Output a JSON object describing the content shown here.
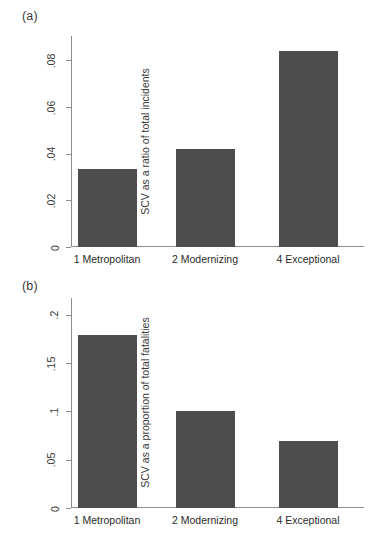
{
  "figure": {
    "panels": [
      {
        "panel_label": "(a)",
        "ylabel": "SCV as a ratio of total incidents",
        "yticks": [
          "0",
          ".02",
          ".04",
          ".06",
          ".08"
        ],
        "categories": [
          "1 Metropolitan",
          "2 Modernizing",
          "4 Exceptional"
        ]
      },
      {
        "panel_label": "(b)",
        "ylabel": "SCV as a proportion of total fatalities",
        "yticks": [
          "0",
          ".05",
          ".1",
          ".15",
          ".2"
        ],
        "categories": [
          "1 Metropolitan",
          "2 Modernizing",
          "4 Exceptional"
        ]
      }
    ]
  },
  "chart_data": [
    {
      "type": "bar",
      "title": "(a)",
      "categories": [
        "1 Metropolitan",
        "2 Modernizing",
        "4 Exceptional"
      ],
      "values": [
        0.0335,
        0.042,
        0.084
      ],
      "xlabel": "",
      "ylabel": "SCV as a ratio of total incidents",
      "ylim": [
        0,
        0.0905
      ],
      "ytick_values": [
        0,
        0.02,
        0.04,
        0.06,
        0.08
      ],
      "ytick_labels": [
        "0",
        ".02",
        ".04",
        ".06",
        ".08"
      ],
      "grid": false,
      "legend": false,
      "bar_color": "#4d4d4d"
    },
    {
      "type": "bar",
      "title": "(b)",
      "categories": [
        "1 Metropolitan",
        "2 Modernizing",
        "4 Exceptional"
      ],
      "values": [
        0.179,
        0.1,
        0.069
      ],
      "xlabel": "",
      "ylabel": "SCV as a proportion of total fatalities",
      "ylim": [
        0,
        0.2175
      ],
      "ytick_values": [
        0,
        0.05,
        0.1,
        0.15,
        0.2
      ],
      "ytick_labels": [
        "0",
        ".05",
        ".1",
        ".15",
        ".2"
      ],
      "grid": false,
      "legend": false,
      "bar_color": "#4d4d4d"
    }
  ]
}
